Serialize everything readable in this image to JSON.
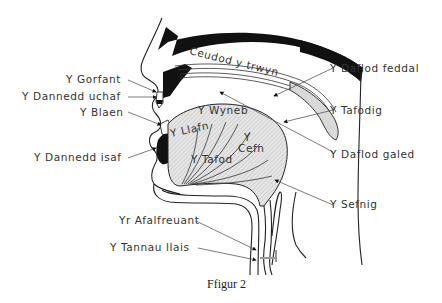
{
  "figure": {
    "caption": "Ffigur 2",
    "colors": {
      "ink": "#222222",
      "shade": "#cfcfcf",
      "background": "#ffffff"
    }
  },
  "labels": {
    "ceudod_y_trwyn": "Ceudod y trwyn",
    "gorfant": "Y Gorfant",
    "dannedd_uchaf": "Y Dannedd uchaf",
    "blaen": "Y Blaen",
    "dannedd_isaf": "Y Dannedd isaf",
    "llafn": "Y Llafn",
    "wyneb": "Y Wyneb",
    "cefn_y": "Y",
    "cefn": "Cefn",
    "tafod": "Y Tafod",
    "daflod_feddal": "Y Daflod feddal",
    "tafodig": "Y Tafodig",
    "daflod_galed": "Y Daflod galed",
    "sefnig": "Y Sefnig",
    "afalfreuant": "Yr Afalfreuant",
    "tannau_llais": "Y Tannau llais"
  }
}
